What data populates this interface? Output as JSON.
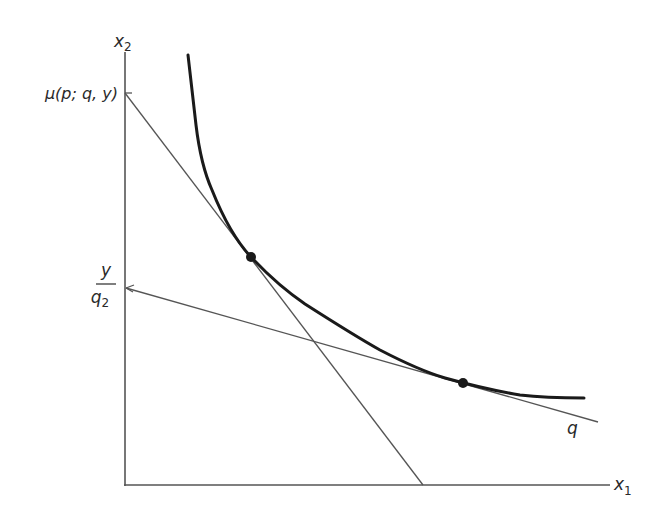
{
  "diagram": {
    "type": "consumer-theory / money metric utility figure",
    "axes": {
      "x_label": "x",
      "x_sub": "1",
      "y_label": "x",
      "y_sub": "2",
      "origin_px": [
        125,
        485
      ],
      "x_end_px": [
        610,
        485
      ],
      "y_end_px": [
        125,
        52
      ]
    },
    "y_axis_labels": {
      "mu": "μ(p; q, y)",
      "budget_num": "y",
      "budget_den": "q",
      "budget_den_sub": "2"
    },
    "line_labels": {
      "q_line": "q"
    },
    "colors": {
      "axis": "#555555",
      "line": "#555555",
      "curve": "#1a1a1a",
      "dot": "#1a1a1a",
      "text": "#2a2a2a"
    },
    "curve": {
      "name": "indifference curve",
      "points_px": [
        [
          188,
          55
        ],
        [
          193,
          100
        ],
        [
          200,
          150
        ],
        [
          226,
          215
        ],
        [
          251,
          257
        ],
        [
          280,
          287
        ],
        [
          330,
          320
        ],
        [
          380,
          350
        ],
        [
          440,
          377
        ],
        [
          463,
          383
        ],
        [
          520,
          395
        ],
        [
          584,
          398
        ]
      ]
    },
    "lines": [
      {
        "name": "budget line at prices p",
        "from_px": [
          125,
          93
        ],
        "to_px": [
          423,
          485
        ]
      },
      {
        "name": "budget line at prices q",
        "from_px": [
          126,
          288
        ],
        "to_px": [
          598,
          422
        ]
      }
    ],
    "tangent_points_px": [
      [
        251,
        257
      ],
      [
        463,
        383
      ]
    ]
  }
}
